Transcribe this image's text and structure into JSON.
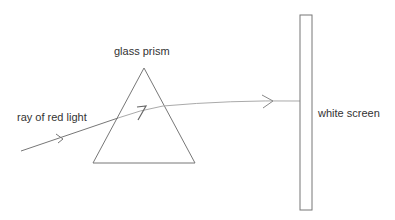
{
  "diagram": {
    "labels": {
      "prism": "glass prism",
      "ray": "ray of red light",
      "screen": "white screen"
    },
    "colors": {
      "line": "#777777",
      "ray_inside": "#aaaaaa",
      "text": "#333333"
    }
  }
}
